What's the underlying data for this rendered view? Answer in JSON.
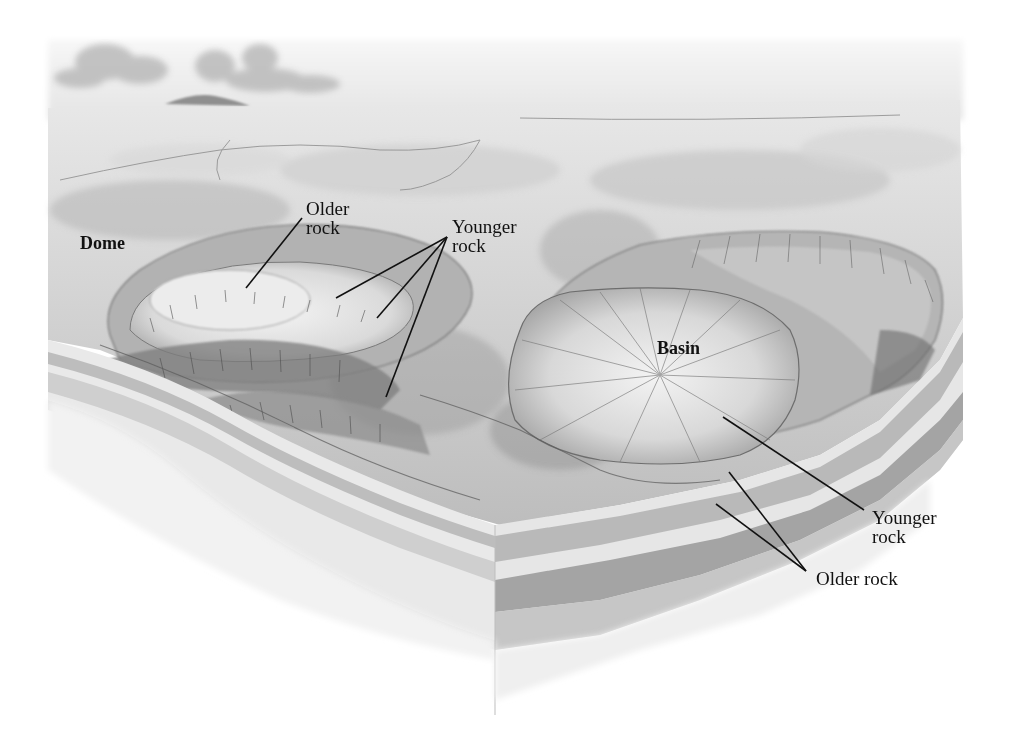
{
  "diagram": {
    "colors": {
      "background": "#ffffff",
      "ink": "#111111",
      "sky_light": "#f2f2f2",
      "terrain_light": "#e6e6e6",
      "terrain_mid": "#c4c4c4",
      "terrain_dark": "#8c8c8c",
      "strata_light": "#ececec",
      "strata_mid": "#cfcfcf",
      "strata_dark": "#a9a9a9"
    },
    "labels": [
      {
        "id": "dome",
        "text": "Dome",
        "x": 80,
        "y": 234,
        "bold": true
      },
      {
        "id": "older-rock-dome",
        "text": "Older\nrock",
        "x": 306,
        "y": 199,
        "bold": false
      },
      {
        "id": "younger-rock-dome",
        "text": "Younger\nrock",
        "x": 452,
        "y": 217,
        "bold": false
      },
      {
        "id": "basin",
        "text": "Basin",
        "x": 657,
        "y": 339,
        "bold": true
      },
      {
        "id": "younger-rock-basin",
        "text": "Younger\nrock",
        "x": 872,
        "y": 508,
        "bold": false
      },
      {
        "id": "older-rock-basin",
        "text": "Older rock",
        "x": 816,
        "y": 569,
        "bold": false
      }
    ],
    "leader_lines": [
      {
        "label": "older-rock-dome",
        "x1": 302,
        "y1": 218,
        "x2": 246,
        "y2": 288
      },
      {
        "label": "younger-rock-dome",
        "x1": 447,
        "y1": 237,
        "x2": 336,
        "y2": 298
      },
      {
        "label": "younger-rock-dome",
        "x1": 447,
        "y1": 237,
        "x2": 377,
        "y2": 318
      },
      {
        "label": "younger-rock-dome",
        "x1": 447,
        "y1": 237,
        "x2": 386,
        "y2": 397
      },
      {
        "label": "younger-rock-basin",
        "x1": 864,
        "y1": 510,
        "x2": 723,
        "y2": 417
      },
      {
        "label": "older-rock-basin",
        "x1": 806,
        "y1": 571,
        "x2": 729,
        "y2": 472
      },
      {
        "label": "older-rock-basin",
        "x1": 806,
        "y1": 571,
        "x2": 716,
        "y2": 504
      }
    ]
  }
}
